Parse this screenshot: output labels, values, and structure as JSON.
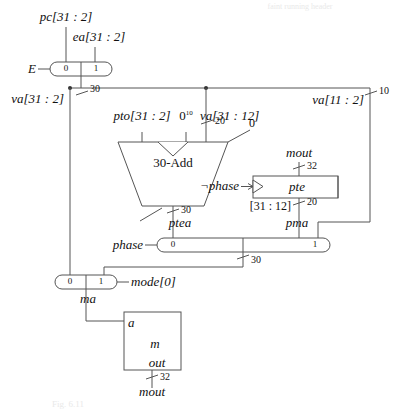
{
  "figure": {
    "header_note": "faint running header",
    "caption": "Fig. 6.11"
  },
  "signals": {
    "pc": "pc[31 : 2]",
    "ea": "ea[31 : 2]",
    "E": "E",
    "va_31_2": "va[31 : 2]",
    "va_31_12": "va[31 : 12]",
    "va_11_2": "va[11 : 2]",
    "pto": "pto[31 : 2]",
    "zeros": "0",
    "zeros_exp": "10",
    "mout_top": "mout",
    "mout_bottom": "mout",
    "not_phase": "¬phase",
    "phase": "phase",
    "ptea": "ptea",
    "pma": "pma",
    "pte_slice": "[31 : 12]",
    "mode0": "mode[0]",
    "ma": "ma"
  },
  "blocks": {
    "adder": {
      "label": "30-Add"
    },
    "pte_register": {
      "label": "pte"
    },
    "memory": {
      "port_in": "a",
      "label": "m",
      "port_out": "out"
    }
  },
  "muxes": {
    "e_mux": {
      "in0": "0",
      "in1": "1",
      "select": "E"
    },
    "phase_mux": {
      "in0": "0",
      "in1": "1",
      "select": "phase"
    },
    "ma_mux": {
      "in0": "0",
      "in1": "1",
      "select": "mode[0]"
    }
  },
  "widths": {
    "e_out": "30",
    "va_branch": "30",
    "va_11_2": "10",
    "va_31_12": "20",
    "adder_out": "30",
    "mout_to_pte": "32",
    "pte_out": "20",
    "phase_mux_out": "30",
    "mem_out": "32"
  },
  "colors": {
    "wire": "#555555",
    "ink": "#111111",
    "block_border": "#555555",
    "faint": "#e9e9e9"
  }
}
